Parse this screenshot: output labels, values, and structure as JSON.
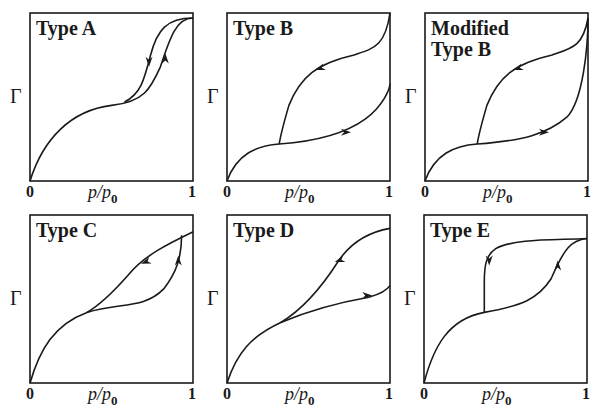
{
  "figure": {
    "y_axis_label": "Γ",
    "x_axis_label_main": "p/p",
    "x_axis_label_sub": "0",
    "x_tick_min": "0",
    "x_tick_max": "1",
    "line_color": "#1a1a1a",
    "panels": [
      {
        "id": "A",
        "title": "Type A"
      },
      {
        "id": "B",
        "title": "Type B"
      },
      {
        "id": "MB",
        "title": "Modified\nType B"
      },
      {
        "id": "C",
        "title": "Type C"
      },
      {
        "id": "D",
        "title": "Type D"
      },
      {
        "id": "E",
        "title": "Type E"
      }
    ]
  },
  "chart_data": [
    {
      "type": "line",
      "title": "Type A",
      "xlabel": "p/p0",
      "ylabel": "Γ",
      "xlim": [
        0,
        1
      ],
      "grid": false,
      "series": [
        {
          "name": "adsorption",
          "x": [
            0,
            0.2,
            0.5,
            0.65,
            0.8,
            0.9,
            1
          ],
          "y": [
            0,
            0.32,
            0.45,
            0.5,
            0.66,
            0.9,
            0.97
          ]
        },
        {
          "name": "desorption",
          "x": [
            1,
            0.85,
            0.75,
            0.68,
            0.6
          ],
          "y": [
            0.97,
            0.92,
            0.78,
            0.58,
            0.5
          ]
        }
      ]
    },
    {
      "type": "line",
      "title": "Type B",
      "xlabel": "p/p0",
      "ylabel": "Γ",
      "xlim": [
        0,
        1
      ],
      "grid": false,
      "series": [
        {
          "name": "adsorption",
          "x": [
            0,
            0.15,
            0.32,
            0.55,
            0.75,
            0.9,
            1
          ],
          "y": [
            0,
            0.16,
            0.22,
            0.26,
            0.33,
            0.44,
            0.58
          ]
        },
        {
          "name": "desorption",
          "x": [
            1,
            0.9,
            0.7,
            0.55,
            0.4,
            0.32
          ],
          "y": [
            1,
            0.79,
            0.73,
            0.62,
            0.45,
            0.22
          ]
        }
      ]
    },
    {
      "type": "line",
      "title": "Modified Type B",
      "xlabel": "p/p0",
      "ylabel": "Γ",
      "xlim": [
        0,
        1
      ],
      "grid": false,
      "series": [
        {
          "name": "adsorption",
          "x": [
            0,
            0.15,
            0.32,
            0.55,
            0.75,
            0.9,
            1
          ],
          "y": [
            0,
            0.16,
            0.22,
            0.26,
            0.33,
            0.5,
            0.97
          ]
        },
        {
          "name": "desorption",
          "x": [
            1,
            0.9,
            0.7,
            0.55,
            0.4,
            0.32
          ],
          "y": [
            0.97,
            0.79,
            0.73,
            0.62,
            0.45,
            0.22
          ]
        }
      ]
    },
    {
      "type": "line",
      "title": "Type C",
      "xlabel": "p/p0",
      "ylabel": "Γ",
      "xlim": [
        0,
        1
      ],
      "grid": false,
      "series": [
        {
          "name": "adsorption",
          "x": [
            0,
            0.15,
            0.35,
            0.6,
            0.8,
            0.9,
            0.93
          ],
          "y": [
            0,
            0.3,
            0.42,
            0.46,
            0.56,
            0.72,
            0.88
          ]
        },
        {
          "name": "desorption",
          "x": [
            1,
            0.93,
            0.7,
            0.5,
            0.35
          ],
          "y": [
            0.9,
            0.88,
            0.72,
            0.56,
            0.42
          ]
        }
      ]
    },
    {
      "type": "line",
      "title": "Type D",
      "xlabel": "p/p0",
      "ylabel": "Γ",
      "xlim": [
        0,
        1
      ],
      "grid": false,
      "series": [
        {
          "name": "adsorption",
          "x": [
            0,
            0.15,
            0.33,
            0.6,
            0.85,
            1
          ],
          "y": [
            0,
            0.22,
            0.35,
            0.46,
            0.52,
            0.58
          ]
        },
        {
          "name": "desorption",
          "x": [
            1,
            0.85,
            0.68,
            0.5,
            0.33
          ],
          "y": [
            0.92,
            0.86,
            0.73,
            0.53,
            0.35
          ]
        }
      ]
    },
    {
      "type": "line",
      "title": "Type E",
      "xlabel": "p/p0",
      "ylabel": "Γ",
      "xlim": [
        0,
        1
      ],
      "grid": false,
      "series": [
        {
          "name": "adsorption",
          "x": [
            0,
            0.15,
            0.37,
            0.65,
            0.8,
            0.9,
            1
          ],
          "y": [
            0,
            0.3,
            0.42,
            0.5,
            0.66,
            0.82,
            0.86
          ]
        },
        {
          "name": "desorption",
          "x": [
            1,
            0.7,
            0.45,
            0.39,
            0.37,
            0.37
          ],
          "y": [
            0.86,
            0.84,
            0.8,
            0.72,
            0.6,
            0.42
          ]
        }
      ]
    }
  ]
}
